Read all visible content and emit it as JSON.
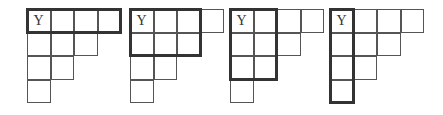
{
  "figure": {
    "shape_rows": [
      4,
      3,
      2,
      1
    ],
    "cell_label": "Y",
    "diagrams": [
      {
        "highlight": {
          "rows": 1,
          "cols": 4
        },
        "label": "Y"
      },
      {
        "highlight": {
          "rows": 2,
          "cols": 3
        },
        "label": "Y"
      },
      {
        "highlight": {
          "rows": 3,
          "cols": 2
        },
        "label": "Y"
      },
      {
        "highlight": {
          "rows": 4,
          "cols": 1
        },
        "label": "Y"
      }
    ],
    "colors": {
      "grid": "#555555",
      "highlight": "#333333",
      "background": "#ffffff"
    }
  }
}
